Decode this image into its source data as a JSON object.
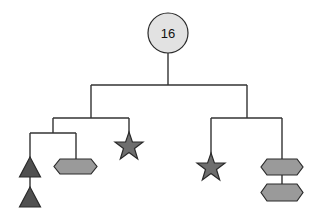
{
  "diagram": {
    "type": "hanging-mobile",
    "root": {
      "label": "16",
      "shape": "circle"
    },
    "colors": {
      "circle_fill": "#e2e2e2",
      "triangle_fill": "#505050",
      "star_fill": "#6e6e6e",
      "hexagon_fill": "#9a9a9a",
      "wire": "#333333"
    },
    "left_branch": {
      "left_sub": {
        "items": [
          "triangle",
          "triangle"
        ],
        "right_items": [
          "hexagon"
        ]
      },
      "right_items": [
        "star"
      ]
    },
    "right_branch": {
      "left_items": [
        "star"
      ],
      "right_items": [
        "hexagon",
        "hexagon"
      ]
    }
  }
}
